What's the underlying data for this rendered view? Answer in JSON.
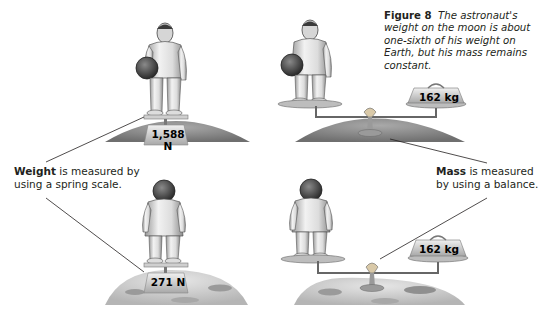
{
  "caption": {
    "figure_label": "Figure 8",
    "text": "The astronaut's weight on the moon is about one-sixth of his weight on Earth, but his mass remains constant."
  },
  "labels": {
    "weight": {
      "bold": "Weight",
      "rest": " is measured by using a spring scale."
    },
    "mass": {
      "bold": "Mass",
      "rest": " is measured by using a balance."
    }
  },
  "panels": {
    "earth_spring_scale": {
      "readout": "1,588 N",
      "location": "Earth"
    },
    "earth_balance": {
      "readout": "162 kg",
      "location": "Earth"
    },
    "moon_spring_scale": {
      "readout": "271 N",
      "location": "Moon"
    },
    "moon_balance": {
      "readout": "162 kg",
      "location": "Moon"
    }
  },
  "colors": {
    "ink": "#231f20",
    "earth_ground": "#8a8a8a",
    "moon_ground": "#c8c8c8",
    "scale_plate": "#d9d9d9",
    "balance_dial": "#c0504d"
  }
}
